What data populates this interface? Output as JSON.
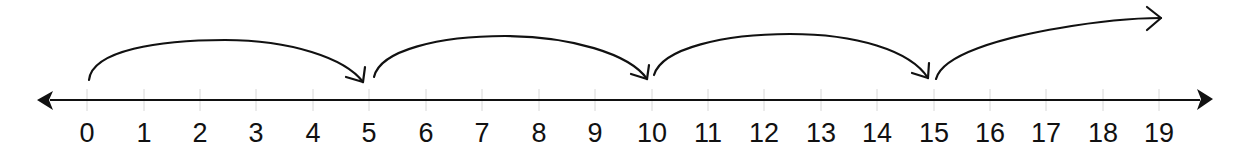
{
  "diagram": {
    "type": "number-line",
    "colors": {
      "line": "#111111",
      "tick": "#d8d8d8",
      "label": "#111111",
      "background": "#ffffff"
    },
    "line": {
      "y": 100,
      "x_start": 37,
      "x_end": 1213,
      "left_arrow": true,
      "right_arrow": true
    },
    "ticks": [
      {
        "value": "0",
        "x": 87
      },
      {
        "value": "1",
        "x": 144
      },
      {
        "value": "2",
        "x": 200
      },
      {
        "value": "3",
        "x": 256
      },
      {
        "value": "4",
        "x": 313
      },
      {
        "value": "5",
        "x": 369
      },
      {
        "value": "6",
        "x": 426
      },
      {
        "value": "7",
        "x": 482
      },
      {
        "value": "8",
        "x": 539
      },
      {
        "value": "9",
        "x": 595
      },
      {
        "value": "10",
        "x": 652
      },
      {
        "value": "11",
        "x": 708
      },
      {
        "value": "12",
        "x": 764
      },
      {
        "value": "13",
        "x": 821
      },
      {
        "value": "14",
        "x": 877
      },
      {
        "value": "15",
        "x": 934
      },
      {
        "value": "16",
        "x": 990
      },
      {
        "value": "17",
        "x": 1046
      },
      {
        "value": "18",
        "x": 1103
      },
      {
        "value": "19",
        "x": 1159
      }
    ],
    "jumps": [
      {
        "from": "0",
        "to": "5",
        "step": 5
      },
      {
        "from": "5",
        "to": "10",
        "step": 5
      },
      {
        "from": "10",
        "to": "15",
        "step": 5
      },
      {
        "from": "15",
        "to": "beyond 19",
        "step": 5
      }
    ]
  }
}
